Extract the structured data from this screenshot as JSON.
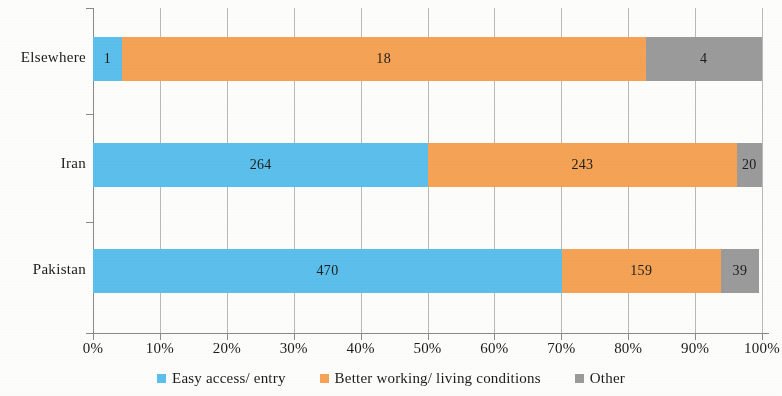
{
  "chart_data": {
    "type": "bar",
    "orientation": "horizontal",
    "stacked": true,
    "normalized": true,
    "title": "",
    "subtitle": "",
    "xlabel": "",
    "ylabel": "",
    "xlim": [
      0,
      100
    ],
    "grid": true,
    "legend_position": "bottom",
    "categories": [
      "Pakistan",
      "Iran",
      "Elsewhere"
    ],
    "x_tick_labels": [
      "0%",
      "10%",
      "20%",
      "30%",
      "40%",
      "50%",
      "60%",
      "70%",
      "80%",
      "90%",
      "100%"
    ],
    "x_tick_values": [
      0,
      10,
      20,
      30,
      40,
      50,
      60,
      70,
      80,
      90,
      100
    ],
    "series": [
      {
        "name": "Easy access/ entry",
        "color": "#5CC0EC",
        "values": [
          470,
          264,
          1
        ],
        "percents": [
          70.1,
          50.1,
          4.3
        ]
      },
      {
        "name": "Better working/ living conditions",
        "color": "#F5A356",
        "values": [
          159,
          243,
          18
        ],
        "percents": [
          23.7,
          46.1,
          78.3
        ]
      },
      {
        "name": "Other",
        "color": "#9B9B9B",
        "values": [
          39,
          20,
          4
        ],
        "percents": [
          5.8,
          3.8,
          17.4
        ]
      }
    ],
    "rows": [
      {
        "category": "Elsewhere",
        "total": 23,
        "segments": [
          {
            "series": "Easy access/ entry",
            "value": "1",
            "percent": 4.3,
            "color": "#5CC0EC"
          },
          {
            "series": "Better working/ living conditions",
            "value": "18",
            "percent": 78.3,
            "color": "#F5A356"
          },
          {
            "series": "Other",
            "value": "4",
            "percent": 17.4,
            "color": "#9B9B9B"
          }
        ]
      },
      {
        "category": "Iran",
        "total": 527,
        "segments": [
          {
            "series": "Easy access/ entry",
            "value": "264",
            "percent": 50.1,
            "color": "#5CC0EC"
          },
          {
            "series": "Better working/ living conditions",
            "value": "243",
            "percent": 46.1,
            "color": "#F5A356"
          },
          {
            "series": "Other",
            "value": "20",
            "percent": 3.8,
            "color": "#9B9B9B"
          }
        ]
      },
      {
        "category": "Pakistan",
        "total": 668,
        "segments": [
          {
            "series": "Easy access/ entry",
            "value": "470",
            "percent": 70.1,
            "color": "#5CC0EC"
          },
          {
            "series": "Better working/ living conditions",
            "value": "159",
            "percent": 23.7,
            "color": "#F5A356"
          },
          {
            "series": "Other",
            "value": "39",
            "percent": 5.8,
            "color": "#9B9B9B"
          }
        ]
      }
    ],
    "legend": [
      {
        "label": "Easy access/ entry",
        "color": "#5CC0EC"
      },
      {
        "label": "Better working/ living conditions",
        "color": "#F5A356"
      },
      {
        "label": "Other",
        "color": "#9B9B9B"
      }
    ]
  },
  "colors": {
    "series_blue": "#5CC0EC",
    "series_orange": "#F5A356",
    "series_grey": "#9B9B9B",
    "axis": "#8a8a8a",
    "grid": "#b9b9b9",
    "text": "#1b1b1b",
    "background": "#fdfdfc"
  }
}
